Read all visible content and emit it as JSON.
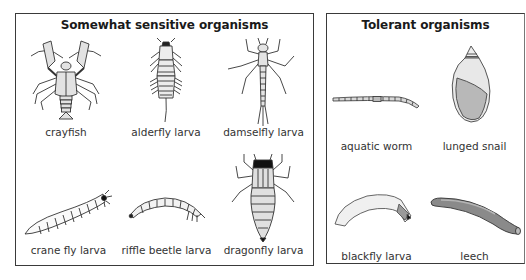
{
  "panels": {
    "sensitive": {
      "title": "Somewhat sensitive organisms",
      "organisms": [
        {
          "name": "crayfish",
          "icon": "crayfish-icon"
        },
        {
          "name": "alderfly larva",
          "icon": "alderfly-larva-icon"
        },
        {
          "name": "damselfly larva",
          "icon": "damselfly-larva-icon"
        },
        {
          "name": "crane fly larva",
          "icon": "crane-fly-larva-icon"
        },
        {
          "name": "riffle beetle larva",
          "icon": "riffle-beetle-larva-icon"
        },
        {
          "name": "dragonfly larva",
          "icon": "dragonfly-larva-icon"
        }
      ]
    },
    "tolerant": {
      "title": "Tolerant organisms",
      "organisms": [
        {
          "name": "aquatic worm",
          "icon": "aquatic-worm-icon"
        },
        {
          "name": "lunged snail",
          "icon": "lunged-snail-icon"
        },
        {
          "name": "blackfly larva",
          "icon": "blackfly-larva-icon"
        },
        {
          "name": "leech",
          "icon": "leech-icon"
        }
      ]
    }
  },
  "colors": {
    "border": "#3a3a3a",
    "outline": "#333333",
    "fill_light": "#e6e6e6",
    "fill_mid": "#bdbdbd",
    "leech": "#8a8a8a"
  }
}
